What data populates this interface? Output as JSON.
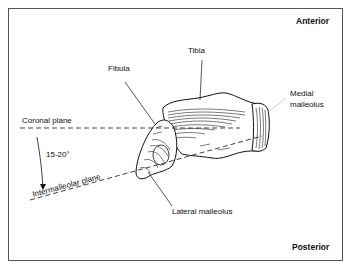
{
  "figure": {
    "orientation": {
      "top": "Anterior",
      "bottom": "Posterior"
    },
    "labels": {
      "tibia": "Tibia",
      "fibula": "Fibula",
      "medial_malleolus_line1": "Medial",
      "medial_malleolus_line2": "malleolus",
      "lateral_malleolus": "Lateral malleolus",
      "coronal_plane": "Coronal plane",
      "intermalleolar_plane": "Intermalleolar plane",
      "angle": "15-20°"
    },
    "colors": {
      "ink": "#111111",
      "border": "#555555",
      "background": "#ffffff"
    }
  }
}
